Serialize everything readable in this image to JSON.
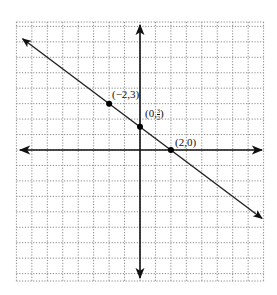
{
  "chart_data": {
    "type": "line",
    "title": "",
    "xlabel": "",
    "ylabel": "",
    "xlim": [
      -8,
      8
    ],
    "ylim": [
      -8.5,
      8.3
    ],
    "grid": true,
    "grid_style": "dotted",
    "series": [
      {
        "name": "line",
        "equation": "y = -3/4 x + 3/2",
        "slope": -0.75,
        "intercept": 1.5,
        "x": [
          -7.6,
          7.9
        ],
        "y": [
          7.2,
          -4.43
        ]
      }
    ],
    "points": [
      {
        "x": -2,
        "y": 3,
        "label": "(−2,3)"
      },
      {
        "x": 0,
        "y": 1.5,
        "label_prefix": "(0,",
        "label_num": "3",
        "label_den": "2",
        "label_suffix": ")"
      },
      {
        "x": 2,
        "y": 0,
        "label": "(2,0)"
      }
    ]
  },
  "colors": {
    "axis": "#111111",
    "line": "#222222",
    "grid": "#8a8a8a",
    "point": "#000000"
  }
}
